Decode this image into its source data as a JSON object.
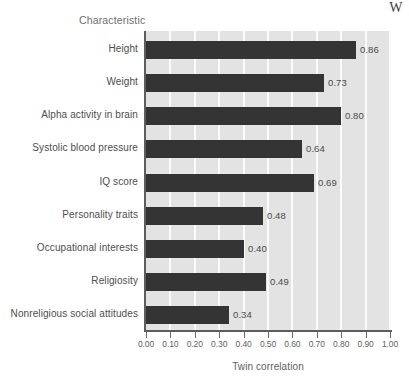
{
  "page": {
    "corner_artifact_text": "W"
  },
  "chart_data": {
    "type": "bar",
    "orientation": "horizontal",
    "title": "",
    "category_axis_title": "Characteristic",
    "xlabel": "Twin correlation",
    "ylabel": "",
    "xlim": [
      0.0,
      1.0
    ],
    "grid": "vertical-white-gridlines",
    "legend": "none",
    "bar_color": "#343434",
    "panel_color": "#e3e3e3",
    "tick_labels": [
      "0.00",
      "0.10",
      "0.20",
      "0.30",
      "0.40",
      "0.50",
      "0.60",
      "0.70",
      "0.80",
      "0.90",
      "1.00"
    ],
    "tick_values": [
      0.0,
      0.1,
      0.2,
      0.3,
      0.4,
      0.5,
      0.6,
      0.7,
      0.8,
      0.9,
      1.0
    ],
    "categories": [
      "Height",
      "Weight",
      "Alpha activity in brain",
      "Systolic blood pressure",
      "IQ score",
      "Personality traits",
      "Occupational interests",
      "Religiosity",
      "Nonreligious social attitudes"
    ],
    "values": [
      0.86,
      0.73,
      0.8,
      0.64,
      0.69,
      0.48,
      0.4,
      0.49,
      0.34
    ],
    "value_labels": [
      "0.86",
      "0.73",
      "0.80",
      "0.64",
      "0.69",
      "0.48",
      "0.40",
      "0.49",
      "0.34"
    ]
  }
}
